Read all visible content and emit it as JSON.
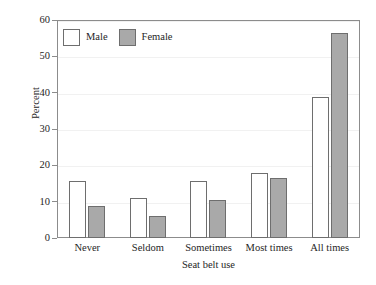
{
  "chart_data": {
    "type": "bar",
    "title": "",
    "xlabel": "Seat belt use",
    "ylabel": "Percent",
    "categories": [
      "Never",
      "Seldom",
      "Sometimes",
      "Most times",
      "All times"
    ],
    "series": [
      {
        "name": "Male",
        "color": "#ffffff",
        "values": [
          15.7,
          11.0,
          15.7,
          18.0,
          38.7
        ]
      },
      {
        "name": "Female",
        "color": "#a9a9a9",
        "values": [
          8.8,
          6.0,
          10.6,
          16.6,
          56.5
        ]
      }
    ],
    "ylim": [
      0,
      60
    ],
    "yticks": [
      0,
      10,
      20,
      30,
      40,
      50,
      60
    ],
    "ytick_labels": [
      "0",
      "10",
      "20",
      "30",
      "40",
      "50",
      "60"
    ],
    "grid": true,
    "legend_position": "top-left",
    "legend_entries": [
      "Male",
      "Female"
    ]
  },
  "colors": {
    "male_fill": "#ffffff",
    "female_fill": "#a9a9a9",
    "bar_border": "#6e6e6e",
    "axis": "#8c8c8c",
    "grid": "#f1f1f1",
    "text": "#262626",
    "background": "#ffffff"
  }
}
